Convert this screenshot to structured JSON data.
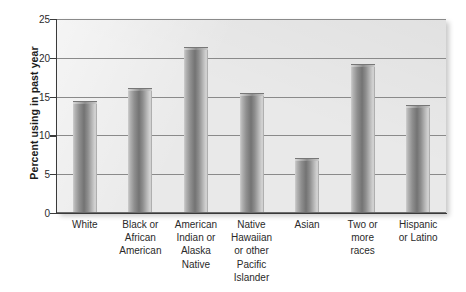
{
  "chart_data": {
    "type": "bar",
    "title": "",
    "subtitle": "",
    "xlabel": "",
    "ylabel": "Percent using in past year",
    "categories": [
      "White",
      "Black or African American",
      "American Indian or Alaska Native",
      "Native Hawaiian or other Pacific Islander",
      "Asian",
      "Two or more races",
      "Hispanic or Latino"
    ],
    "category_lines": [
      [
        "White"
      ],
      [
        "Black or",
        "African",
        "American"
      ],
      [
        "American",
        "Indian or",
        "Alaska",
        "Native"
      ],
      [
        "Native",
        "Hawaiian",
        "or other",
        "Pacific",
        "Islander"
      ],
      [
        "Asian"
      ],
      [
        "Two or",
        "more",
        "races"
      ],
      [
        "Hispanic",
        "or Latino"
      ]
    ],
    "values": [
      14.4,
      16.1,
      21.4,
      15.5,
      7.1,
      19.2,
      13.9
    ],
    "ylim": [
      0,
      25
    ],
    "yticks": [
      0,
      5,
      10,
      15,
      20,
      25
    ],
    "ytick_labels": [
      "0",
      "5",
      "10",
      "15",
      "20",
      "25"
    ],
    "grid": true,
    "grid_axis": "y",
    "legend": false,
    "legend_position": "none",
    "bar_color": "#8f8f8f",
    "plot_background": "#e9e9e9",
    "axis_color": "#3a3a3a",
    "gridline_color": "#8a8a8a"
  }
}
